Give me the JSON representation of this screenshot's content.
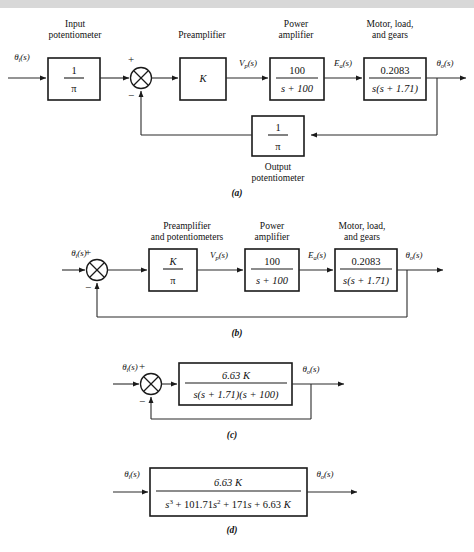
{
  "figure": {
    "type": "block-diagram",
    "background": "#ffffff",
    "line_color": "#2b2b2b",
    "box_color": "#ffffff",
    "box_border": "#1a1a1a",
    "banner_color": "#d8d8d8"
  },
  "diagrams": [
    {
      "id": "a",
      "caption": "(a)",
      "blocks": [
        {
          "name": "input-potentiometer",
          "title_lines": [
            "Input",
            "potentiometer"
          ],
          "numerator": "1",
          "denominator": "π"
        },
        {
          "name": "preamplifier",
          "title_lines": [
            "Preamplifier"
          ],
          "gain": "K"
        },
        {
          "name": "power-amplifier",
          "title_lines": [
            "Power",
            "amplifier"
          ],
          "numerator": "100",
          "denominator": "s + 100"
        },
        {
          "name": "motor-load-gears",
          "title_lines": [
            "Motor, load,",
            "and gears"
          ],
          "numerator": "0.2083",
          "denominator": "s(s + 1.71)"
        },
        {
          "name": "output-potentiometer",
          "title_lines": [
            "Output",
            "potentiometer"
          ],
          "numerator": "1",
          "denominator": "π"
        }
      ],
      "signals": {
        "input": "θi(s)",
        "preamp_out": "Vp(s)",
        "power_out": "Ea(s)",
        "output": "θo(s)"
      },
      "summing_junction": {
        "name": "summing-junction",
        "plus": "+",
        "minus": "−"
      }
    },
    {
      "id": "b",
      "caption": "(b)",
      "blocks": [
        {
          "name": "preamplifier-and-potentiometers",
          "title_lines": [
            "Preamplifier",
            "and potentiometers"
          ],
          "numerator": "K",
          "denominator": "π"
        },
        {
          "name": "power-amplifier",
          "title_lines": [
            "Power",
            "amplifier"
          ],
          "numerator": "100",
          "denominator": "s + 100"
        },
        {
          "name": "motor-load-gears",
          "title_lines": [
            "Motor, load,",
            "and gears"
          ],
          "numerator": "0.2083",
          "denominator": "s(s + 1.71)"
        }
      ],
      "signals": {
        "input": "θi(s)",
        "preamp_out": "Vp(s)",
        "power_out": "Ea(s)",
        "output": "θo(s)"
      },
      "summing_junction": {
        "name": "summing-junction",
        "plus": "+",
        "minus": "−"
      }
    },
    {
      "id": "c",
      "caption": "(c)",
      "blocks": [
        {
          "name": "forward-path-transfer-function",
          "title_lines": [],
          "numerator": "6.63 K",
          "denominator": "s(s + 1.71)(s + 100)"
        }
      ],
      "signals": {
        "input": "θi(s)",
        "output": "θo(s)"
      },
      "summing_junction": {
        "name": "summing-junction",
        "plus": "+",
        "minus": "−"
      }
    },
    {
      "id": "d",
      "caption": "(d)",
      "blocks": [
        {
          "name": "closed-loop-transfer-function",
          "title_lines": [],
          "numerator": "6.63 K",
          "denominator": "s3 + 101.71s2 + 171s + 6.63 K",
          "denominator_parts": {
            "term1_base": "s",
            "term1_exp": "3",
            "term2_coef": " + 101.71",
            "term2_base": "s",
            "term2_exp": "2",
            "term3": " + 171",
            "term3_var": "s",
            "term4": " + 6.63 ",
            "term4_var": "K"
          }
        }
      ],
      "signals": {
        "input": "θi(s)",
        "output": "θo(s)"
      }
    }
  ]
}
